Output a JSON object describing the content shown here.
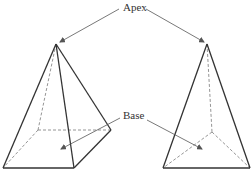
{
  "labels": {
    "apex": "Apex",
    "base": "Base"
  },
  "colors": {
    "stroke": "#333333",
    "dashed": "#7a7a7a",
    "arrow": "#555555",
    "background": "#ffffff"
  },
  "figures": [
    {
      "name": "square-pyramid",
      "apex": [
        56,
        44
      ],
      "base_vertices": [
        [
          3,
          168
        ],
        [
          74,
          168
        ],
        [
          111,
          130
        ],
        [
          38,
          130
        ]
      ]
    },
    {
      "name": "triangular-pyramid",
      "apex": [
        207,
        44
      ],
      "base_vertices": [
        [
          163,
          168
        ],
        [
          251,
          168
        ],
        [
          210,
          130
        ]
      ]
    }
  ]
}
